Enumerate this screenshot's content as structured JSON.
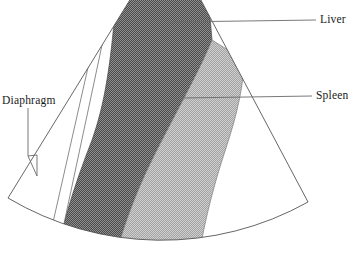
{
  "figure": {
    "type": "ultrasound-sector-schematic",
    "title": "",
    "width": 348,
    "height": 267,
    "background_color": "#ffffff"
  },
  "labels": {
    "liver": "Liver",
    "spleen": "Spleen",
    "diaphragm": "Diaphragm"
  },
  "colors": {
    "liver_fill": "#6e6e6e",
    "spleen_fill": "#b2b2b2",
    "outline": "#555555",
    "leader_line": "#6a6a6a",
    "text": "#1a1a1a",
    "sector_fill": "#ffffff"
  },
  "regions": [
    {
      "name": "liver",
      "label": "Liver",
      "fill": "#6e6e6e",
      "pattern": "dark-dither",
      "leader_start": [
        172,
        22
      ],
      "leader_end": [
        316,
        20
      ]
    },
    {
      "name": "spleen",
      "label": "Spleen",
      "fill": "#b2b2b2",
      "pattern": "light-dither",
      "leader_start": [
        182,
        98
      ],
      "leader_end": [
        313,
        96
      ]
    },
    {
      "name": "diaphragm",
      "label": "Diaphragm",
      "fill": "#ffffff",
      "pattern": "none",
      "leader_start": [
        32,
        176
      ],
      "leader_end": [
        28,
        108
      ]
    }
  ],
  "sector": {
    "apex": [
      168,
      -62
    ],
    "left_edge_end": [
      8,
      198
    ],
    "right_edge_end": [
      308,
      202
    ],
    "arc_bottom_y": 267
  }
}
